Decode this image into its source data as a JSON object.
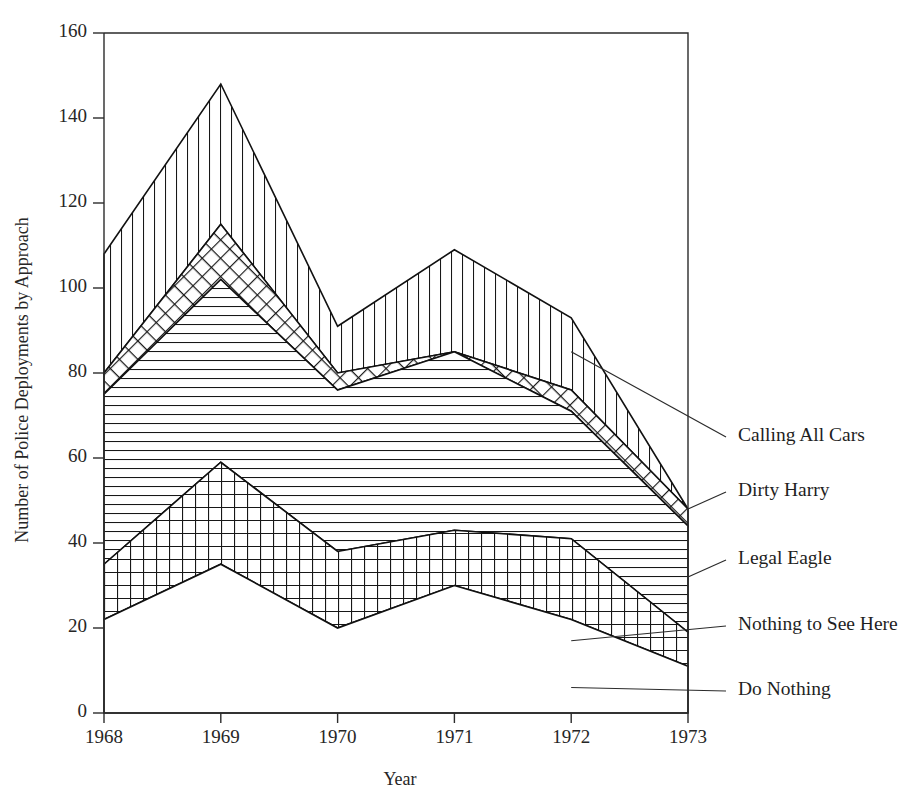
{
  "chart_data": {
    "type": "area",
    "title": "",
    "subtitle": "",
    "xlabel": "Year",
    "ylabel": "Number of Police Deployments by Approach",
    "categories": [
      "1968",
      "1969",
      "1970",
      "1971",
      "1972",
      "1973"
    ],
    "x": [
      1968,
      1969,
      1970,
      1971,
      1972,
      1973
    ],
    "xlim": [
      1968,
      1973
    ],
    "ylim": [
      0,
      160
    ],
    "ytick_labels": [
      "0",
      "20",
      "40",
      "60",
      "80",
      "100",
      "120",
      "140",
      "160"
    ],
    "yticks": [
      0,
      20,
      40,
      60,
      80,
      100,
      120,
      140,
      160
    ],
    "grid": false,
    "legend_position": "right-annotations",
    "stacked": true,
    "stack_order_bottom_to_top": [
      "Do Nothing",
      "Nothing to See Here",
      "Legal Eagle",
      "Dirty Harry",
      "Calling All Cars"
    ],
    "series": [
      {
        "name": "Do Nothing",
        "fill": "blank",
        "values": [
          22,
          35,
          20,
          30,
          22,
          11
        ]
      },
      {
        "name": "Nothing to See Here",
        "fill": "grid",
        "values": [
          13,
          24,
          18,
          13,
          19,
          8
        ]
      },
      {
        "name": "Legal Eagle",
        "fill": "horizontal-lines",
        "values": [
          40,
          43,
          38,
          42,
          30,
          25
        ]
      },
      {
        "name": "Dirty Harry",
        "fill": "cross-diagonal",
        "values": [
          5,
          13,
          4,
          0,
          5,
          4
        ]
      },
      {
        "name": "Calling All Cars",
        "fill": "vertical-lines",
        "values": [
          28,
          33,
          11,
          24,
          17,
          0
        ]
      }
    ],
    "cumulative_tops": {
      "Do Nothing": [
        22,
        35,
        20,
        30,
        22,
        11
      ],
      "Nothing to See Here": [
        35,
        59,
        38,
        43,
        41,
        19
      ],
      "Legal Eagle": [
        75,
        102,
        76,
        85,
        71,
        44
      ],
      "Dirty Harry": [
        80,
        115,
        80,
        85,
        76,
        48
      ],
      "Calling All Cars": [
        108,
        148,
        91,
        109,
        93,
        48
      ]
    },
    "annotations": [
      {
        "label": "Calling All Cars",
        "target_year": 1972,
        "target_value": 85
      },
      {
        "label": "Dirty Harry",
        "target_year": 1973,
        "target_value": 48
      },
      {
        "label": "Legal Eagle",
        "target_year": 1973,
        "target_value": 32
      },
      {
        "label": "Nothing to See Here",
        "target_year": 1972,
        "target_value": 17
      },
      {
        "label": "Do Nothing",
        "target_year": 1972,
        "target_value": 6
      }
    ]
  }
}
